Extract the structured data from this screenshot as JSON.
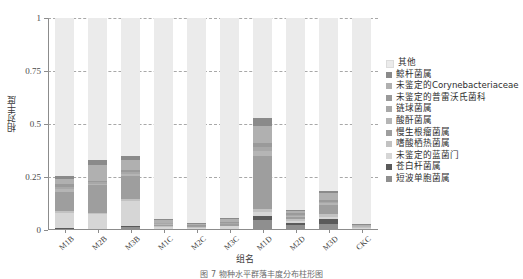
{
  "chart_data": {
    "type": "bar",
    "subtype": "stacked-bar",
    "title": "",
    "xlabel": "组名",
    "ylabel": "相对丰度",
    "ylim": [
      0,
      1
    ],
    "yticks": [
      "0",
      "0.25",
      "0.5",
      "0.75",
      "1"
    ],
    "ytick_values": [
      0,
      0.25,
      0.5,
      0.75,
      1
    ],
    "grid": "horizontal-dashed",
    "legend_position": "right",
    "categories": [
      "M1B",
      "M2B",
      "M3B",
      "M1C",
      "M2C",
      "M3C",
      "M1D",
      "M2D",
      "M3D",
      "CKC"
    ],
    "series": [
      {
        "name": "短波单胞菌属",
        "color": "#8f8f8f",
        "values": [
          0.005,
          0.004,
          0.012,
          0.004,
          0.003,
          0.004,
          0.048,
          0.022,
          0.028,
          0.003
        ]
      },
      {
        "name": "苍白杆菌属",
        "color": "#5a5a5a",
        "values": [
          0.004,
          0.003,
          0.006,
          0.003,
          0.002,
          0.003,
          0.016,
          0.012,
          0.022,
          0.002
        ]
      },
      {
        "name": "未鉴定的蓝菌门",
        "color": "#d6d6d6",
        "values": [
          0.072,
          0.068,
          0.12,
          0.008,
          0.005,
          0.01,
          0.02,
          0.01,
          0.012,
          0.004
        ]
      },
      {
        "name": "嗜酸栖热菌属",
        "color": "#c2c2c2",
        "values": [
          0.008,
          0.006,
          0.008,
          0.004,
          0.003,
          0.004,
          0.016,
          0.008,
          0.014,
          0.003
        ]
      },
      {
        "name": "慢生根瘤菌属",
        "color": "#9e9e9e",
        "values": [
          0.092,
          0.13,
          0.108,
          0.006,
          0.004,
          0.006,
          0.25,
          0.01,
          0.04,
          0.003
        ]
      },
      {
        "name": "酸酐菌属",
        "color": "#b5b5b5",
        "values": [
          0.014,
          0.008,
          0.01,
          0.003,
          0.002,
          0.003,
          0.022,
          0.006,
          0.01,
          0.002
        ]
      },
      {
        "name": "链球菌属",
        "color": "#a8a8a8",
        "values": [
          0.01,
          0.006,
          0.008,
          0.003,
          0.002,
          0.003,
          0.018,
          0.005,
          0.008,
          0.002
        ]
      },
      {
        "name": "未鉴定的普雷沃氏菌科",
        "color": "#9a9a9a",
        "values": [
          0.012,
          0.008,
          0.01,
          0.004,
          0.003,
          0.004,
          0.02,
          0.006,
          0.01,
          0.002
        ]
      },
      {
        "name": "未鉴定的Corynebacteriaceae",
        "color": "#b0b0b0",
        "values": [
          0.026,
          0.075,
          0.048,
          0.013,
          0.005,
          0.014,
          0.082,
          0.011,
          0.03,
          0.004
        ]
      },
      {
        "name": "鲸杆菌属",
        "color": "#8a8a8a",
        "values": [
          0.012,
          0.022,
          0.018,
          0.005,
          0.003,
          0.005,
          0.038,
          0.005,
          0.012,
          0.002
        ]
      },
      {
        "name": "其他",
        "color": "#ebebeb",
        "values": [
          0.745,
          0.67,
          0.652,
          0.947,
          0.968,
          0.944,
          0.47,
          0.905,
          0.814,
          0.975
        ]
      }
    ]
  },
  "axes": {
    "y_title": "相对丰度",
    "x_title": "组名",
    "y_ticks": [
      "0",
      "0.25",
      "0.5",
      "0.75",
      "1"
    ],
    "x_ticks": [
      "M1B",
      "M2B",
      "M3B",
      "M1C",
      "M2C",
      "M3C",
      "M1D",
      "M2D",
      "M3D",
      "CKC"
    ]
  },
  "legend": {
    "items": [
      {
        "label": "其他",
        "color": "#ebebeb"
      },
      {
        "label": "鲸杆菌属",
        "color": "#8a8a8a"
      },
      {
        "label": "未鉴定的Corynebacteriaceae",
        "color": "#b0b0b0"
      },
      {
        "label": "未鉴定的普雷沃氏菌科",
        "color": "#9a9a9a"
      },
      {
        "label": "链球菌属",
        "color": "#a8a8a8"
      },
      {
        "label": "酸酐菌属",
        "color": "#b5b5b5"
      },
      {
        "label": "慢生根瘤菌属",
        "color": "#9e9e9e"
      },
      {
        "label": "嗜酸栖热菌属",
        "color": "#c2c2c2"
      },
      {
        "label": "未鉴定的蓝菌门",
        "color": "#d6d6d6"
      },
      {
        "label": "苍白杆菌属",
        "color": "#5a5a5a"
      },
      {
        "label": "短波单胞菌属",
        "color": "#8f8f8f"
      }
    ]
  },
  "caption": {
    "text": "图 7  物种水平群落丰度分布柱形图"
  }
}
